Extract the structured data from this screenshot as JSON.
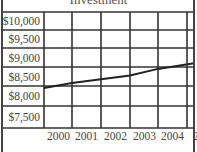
{
  "chart_data": {
    "type": "line",
    "title": "Investment",
    "xlabel": "",
    "ylabel": "",
    "x": [
      "2000",
      "2001",
      "2002",
      "2003",
      "2004",
      "2005"
    ],
    "y_tick_labels": [
      "$10,000",
      "$9,500",
      "$9,000",
      "$8,500",
      "$8,000",
      "$7,500"
    ],
    "x_tick_labels": [
      "2000",
      "2001",
      "2002",
      "2003",
      "2004",
      "2"
    ],
    "series": [
      {
        "name": "Value",
        "values": [
          8450,
          8580,
          8680,
          8780,
          8950,
          9100
        ]
      }
    ],
    "ylim": [
      7500,
      10000
    ],
    "grid": true,
    "legend": "none"
  }
}
